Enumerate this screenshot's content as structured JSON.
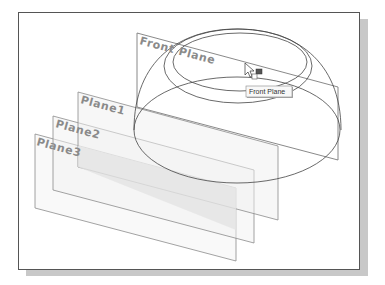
{
  "viewport": {
    "background": "#ffffff",
    "frame_border": "#555555",
    "shadow": "#c8c8c8"
  },
  "planes": [
    {
      "id": "front-plane",
      "label": "Front Plane",
      "points": [
        [
          137,
          33
        ],
        [
          338,
          87
        ],
        [
          338,
          160
        ],
        [
          137,
          107
        ]
      ],
      "label_pos": [
        139,
        44
      ]
    },
    {
      "id": "plane1",
      "label": "Plane1",
      "points": [
        [
          78,
          92
        ],
        [
          278,
          146
        ],
        [
          278,
          220
        ],
        [
          78,
          167
        ]
      ],
      "label_pos": [
        80,
        102
      ]
    },
    {
      "id": "plane2",
      "label": "Plane2",
      "points": [
        [
          53,
          116
        ],
        [
          254,
          170
        ],
        [
          254,
          243
        ],
        [
          53,
          190
        ]
      ],
      "label_pos": [
        55,
        126
      ]
    },
    {
      "id": "plane3",
      "label": "Plane3",
      "points": [
        [
          35,
          134
        ],
        [
          236,
          188
        ],
        [
          236,
          261
        ],
        [
          35,
          208
        ]
      ],
      "label_pos": [
        36,
        144
      ]
    }
  ],
  "model": {
    "name": "dome-part",
    "base_ellipse": {
      "cx": 237,
      "cy": 130,
      "rx": 103,
      "ry": 53
    },
    "rim_outer": {
      "cx": 238,
      "cy": 66,
      "rx": 74,
      "ry": 37
    },
    "rim_inner": {
      "cx": 240,
      "cy": 62,
      "rx": 67,
      "ry": 29
    }
  },
  "tooltip": {
    "text": "Front Plane",
    "x": 246,
    "y": 86,
    "width": 46,
    "height": 11
  },
  "cursor": {
    "type": "arrow-pointer",
    "x": 245,
    "y": 63
  },
  "colors": {
    "plane_edge": "#8c8c8c",
    "plane_fill": "#e6e6e6",
    "model_edge": "#444444",
    "label": "#8a8a8a"
  }
}
